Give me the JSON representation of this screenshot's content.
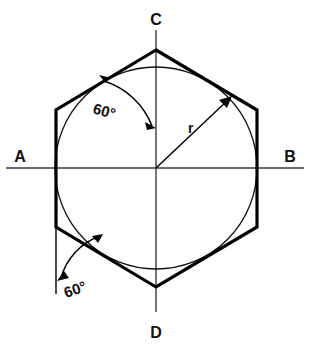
{
  "figure": {
    "canvas": {
      "width": 310,
      "height": 350,
      "background": "#ffffff"
    },
    "colors": {
      "hexagon_stroke": "#000000",
      "circle_stroke": "#111111",
      "axis_stroke": "#3a3a3a",
      "annotation_stroke": "#000000",
      "label_fill": "#111111"
    },
    "geometry": {
      "center": {
        "x": 156,
        "y": 168
      },
      "circle_radius": 101,
      "hexagon_circumradius": 117,
      "hexagon_orientation": "pointy-top",
      "hexagon_vertices": [
        {
          "name": "top",
          "x": 156,
          "y": 50
        },
        {
          "name": "upper-right",
          "x": 257,
          "y": 110
        },
        {
          "name": "lower-right",
          "x": 257,
          "y": 227
        },
        {
          "name": "bottom",
          "x": 156,
          "y": 287
        },
        {
          "name": "lower-left",
          "x": 56,
          "y": 227
        },
        {
          "name": "upper-left",
          "x": 56,
          "y": 110
        }
      ],
      "horizontal_axis": {
        "x1": 6,
        "y1": 168,
        "x2": 304,
        "y2": 168
      },
      "vertical_axis": {
        "x1": 156,
        "y1": 30,
        "x2": 156,
        "y2": 312
      }
    },
    "labels": {
      "left_vertex": "A",
      "right_vertex": "B",
      "top_vertex": "C",
      "bottom_vertex": "D",
      "radius": "r",
      "angle_upper": "60°",
      "angle_lower": "60°"
    },
    "annotations": [
      {
        "name": "upper-angle-dimension",
        "label": "60°",
        "value": 60,
        "unit": "degrees",
        "description": "arc from the upper-left hexagon edge to the vertical centerline, arrowheads at both ends"
      },
      {
        "name": "radius-dimension",
        "label": "r",
        "description": "leader line from center to the circle at the upper right with a single arrowhead"
      },
      {
        "name": "lower-angle-dimension",
        "label": "60°",
        "value": 60,
        "unit": "degrees",
        "description": "arc from the vertical extension line at the lower-left vertex to the lower-left hexagon edge, arrowheads at both ends"
      }
    ]
  }
}
